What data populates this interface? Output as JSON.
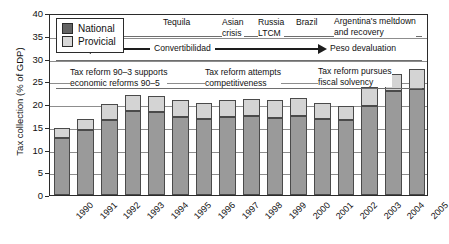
{
  "chart_data": {
    "type": "bar",
    "title": "",
    "xlabel": "",
    "ylabel": "Tax collection (% of GDP)",
    "ylim": [
      0,
      40
    ],
    "yticks": [
      0,
      5,
      10,
      15,
      20,
      25,
      30,
      35,
      40
    ],
    "grid": true,
    "stacked": true,
    "legend_position": "top-left",
    "categories": [
      "1990",
      "1991",
      "1992",
      "1993",
      "1994",
      "1995",
      "1996",
      "1997",
      "1998",
      "1999",
      "2000",
      "2001",
      "2002",
      "2003",
      "2004",
      "2005"
    ],
    "series": [
      {
        "name": "National",
        "color": "#9a9a9a",
        "values": [
          12.5,
          14.2,
          16.5,
          18.4,
          18.2,
          17.2,
          16.6,
          17.2,
          17.4,
          17.0,
          17.4,
          16.8,
          16.4,
          19.5,
          22.8,
          23.4
        ]
      },
      {
        "name": "Provicial",
        "color": "#d4d4d4",
        "values": [
          2.3,
          2.6,
          3.4,
          3.6,
          3.6,
          3.6,
          3.6,
          3.7,
          3.8,
          3.8,
          3.9,
          3.5,
          3.2,
          4.3,
          3.9,
          4.3
        ]
      }
    ],
    "totals": [
      14.8,
      16.8,
      19.9,
      22.0,
      21.8,
      20.8,
      20.2,
      20.9,
      21.2,
      20.8,
      21.3,
      20.3,
      19.6,
      23.8,
      26.7,
      27.7
    ],
    "annotations": [
      {
        "name": "tequila",
        "text": "Tequila"
      },
      {
        "name": "asian-crisis",
        "text": "Asian\ncrisis"
      },
      {
        "name": "russia-ltcm",
        "text": "Russia\nLTCM"
      },
      {
        "name": "brazil",
        "text": "Brazil"
      },
      {
        "name": "argentina-meltdown",
        "text": "Argentina's meltdown\nand recovery"
      },
      {
        "name": "convertibilidad",
        "text": "Convertibilidad"
      },
      {
        "name": "peso-devaluation",
        "text": "Peso devaluation"
      },
      {
        "name": "tax-reform-90-3",
        "text": "Tax reform 90–3 supports\neconomic reforms 90–5"
      },
      {
        "name": "tax-reform-competitiveness",
        "text": "Tax reform attempts\ncompetitiveness"
      },
      {
        "name": "tax-reform-fiscal-solvency",
        "text": "Tax reform pursues\nfiscal solvency"
      }
    ]
  },
  "legend": {
    "items": [
      {
        "label": "National",
        "color": "#636363"
      },
      {
        "label": "Provicial",
        "color": "#d8d8d8"
      }
    ]
  },
  "axis": {
    "y_title": "Tax collection (% of GDP)",
    "y_tick_labels": [
      "0",
      "5",
      "10",
      "15",
      "20",
      "25",
      "30",
      "35",
      "40"
    ],
    "x_tick_labels": [
      "1990",
      "1991",
      "1992",
      "1993",
      "1994",
      "1995",
      "1996",
      "1997",
      "1998",
      "1999",
      "2000",
      "2001",
      "2002",
      "2003",
      "2004",
      "2005"
    ]
  },
  "annotation_text": {
    "tequila": "Tequila",
    "asian_crisis": "Asian\ncrisis",
    "russia_ltcm": "Russia\nLTCM",
    "brazil": "Brazil",
    "argentina": "Argentina's meltdown\nand recovery",
    "convertibilidad": "Convertibilidad",
    "peso_devaluation": "Peso devaluation",
    "reform_90_3": "Tax reform 90–3 supports\neconomic reforms 90–5",
    "reform_competitiveness": "Tax reform attempts\ncompetitiveness",
    "reform_fiscal": "Tax reform pursues\nfiscal solvency"
  }
}
